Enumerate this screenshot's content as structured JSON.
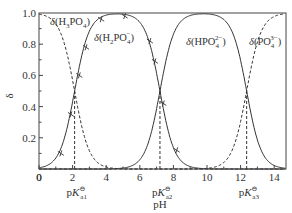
{
  "chart_data": {
    "type": "line",
    "title": "",
    "xlabel": "pH",
    "ylabel": "δ",
    "xlim": [
      0,
      14.7
    ],
    "ylim": [
      0,
      1.0
    ],
    "x_ticks": [
      "0",
      "2",
      "4",
      "6",
      "8",
      "10",
      "12",
      "14"
    ],
    "y_ticks": [
      "0.2",
      "0.4",
      "0.6",
      "0.8",
      "1.0"
    ],
    "grid": false,
    "pKa": [
      {
        "label": "pK",
        "sub": "a1",
        "value": 2.12
      },
      {
        "label": "pK",
        "sub": "a2",
        "value": 7.2
      },
      {
        "label": "pK",
        "sub": "a3",
        "value": 12.36
      }
    ],
    "series": [
      {
        "name": "δ(H3PO4)",
        "label_main": "δ(H",
        "label_sub": "3",
        "label_rest": "PO",
        "label_sub2": "4",
        "label_end": ")",
        "style": "dashed"
      },
      {
        "name": "δ(H2PO4−)",
        "label_main": "δ(H",
        "label_sub": "2",
        "label_rest": "PO",
        "label_sub2": "4",
        "label_sup": "−",
        "label_end": ")",
        "style": "solid",
        "markers": "x"
      },
      {
        "name": "δ(HPO4 2−)",
        "label_main": "δ(HPO",
        "label_sub": "4",
        "label_sup": "2−",
        "label_end": ")",
        "style": "solid"
      },
      {
        "name": "δ(PO4 3−)",
        "label_main": "δ(PO",
        "label_sub": "4",
        "label_sup": "3−",
        "label_end": ")",
        "style": "dashed"
      }
    ],
    "markers": [
      {
        "x": 1.3,
        "y": 0.1
      },
      {
        "x": 1.9,
        "y": 0.35
      },
      {
        "x": 2.4,
        "y": 0.6
      },
      {
        "x": 2.8,
        "y": 0.78
      },
      {
        "x": 3.7,
        "y": 0.96
      },
      {
        "x": 5.1,
        "y": 0.98
      },
      {
        "x": 6.6,
        "y": 0.82
      },
      {
        "x": 6.9,
        "y": 0.69
      },
      {
        "x": 7.4,
        "y": 0.42
      },
      {
        "x": 8.2,
        "y": 0.12
      }
    ]
  }
}
